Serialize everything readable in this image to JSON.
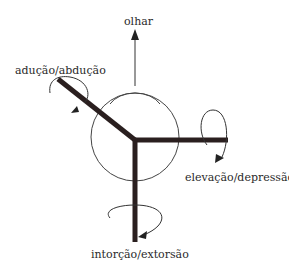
{
  "diagram": {
    "labels": {
      "gaze": "olhar",
      "adduction_abduction": "adução/abdução",
      "elevation_depression": "elevação/depressão",
      "intorsion_extorsion": "intorção/extorsão"
    },
    "colors": {
      "stroke": "#2a1f1f",
      "line": "#333333",
      "background": "#ffffff"
    }
  }
}
